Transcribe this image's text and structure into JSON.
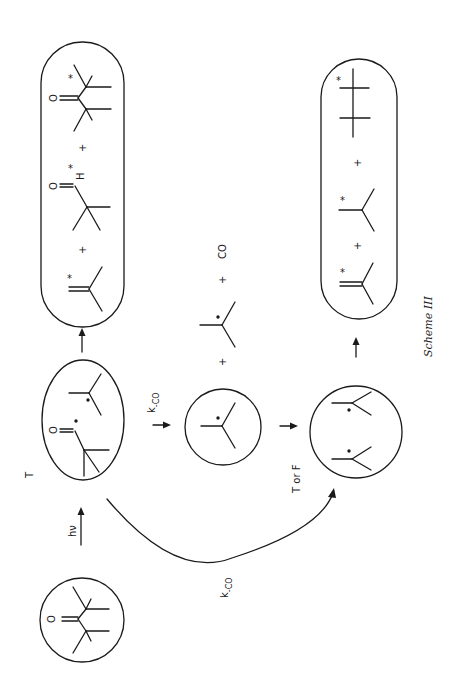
{
  "scheme": {
    "caption": "Scheme III",
    "orientation": "rotated 90° counter-clockwise (reads bottom-to-top)"
  },
  "labels": {
    "hv": "hν",
    "triplet": "T",
    "k_co_upper": "k",
    "k_co_upper_sub": "-CO",
    "k_co_lower": "k",
    "k_co_lower_sub": "-CO",
    "t_or_f": "T or F",
    "co": "CO",
    "oxygen": "O",
    "hydrogen": "H",
    "plus": "+",
    "star": "*",
    "radical_dot": "•"
  },
  "nodes": [
    {
      "id": "ketone",
      "label": "di-tert-butyl ketone (ground state)",
      "shape": "circle"
    },
    {
      "id": "radical-pair-acyl",
      "label": "pivaloyl + tert-butyl radical pair (triplet)",
      "shape": "ellipse"
    },
    {
      "id": "tert-butyl-radical",
      "label": "tert-butyl radical",
      "shape": "circle"
    },
    {
      "id": "radical-pair-alkyl",
      "label": "tert-butyl radical pair",
      "shape": "circle"
    },
    {
      "id": "products-acyl",
      "label": "isobutylene* + pivaldehyde* + di-tert-butyl ketone*",
      "shape": "capsule"
    },
    {
      "id": "products-alkyl",
      "label": "isobutylene* + isobutane* + 2,2,3,3-tetramethylbutane*",
      "shape": "capsule"
    }
  ],
  "edges": [
    {
      "from": "ketone",
      "to": "radical-pair-acyl",
      "label": "hν",
      "note": "T"
    },
    {
      "from": "radical-pair-acyl",
      "to": "products-acyl",
      "label": ""
    },
    {
      "from": "radical-pair-acyl",
      "to": "tert-butyl-radical",
      "label": "k-CO",
      "side_products": [
        "tert-butyl radical",
        "CO"
      ]
    },
    {
      "from": "radical-pair-acyl",
      "to": "radical-pair-alkyl",
      "label": "k-CO",
      "curved": true
    },
    {
      "from": "tert-butyl-radical",
      "to": "radical-pair-alkyl",
      "label": "T or F"
    },
    {
      "from": "radical-pair-alkyl",
      "to": "products-alkyl",
      "label": ""
    }
  ]
}
